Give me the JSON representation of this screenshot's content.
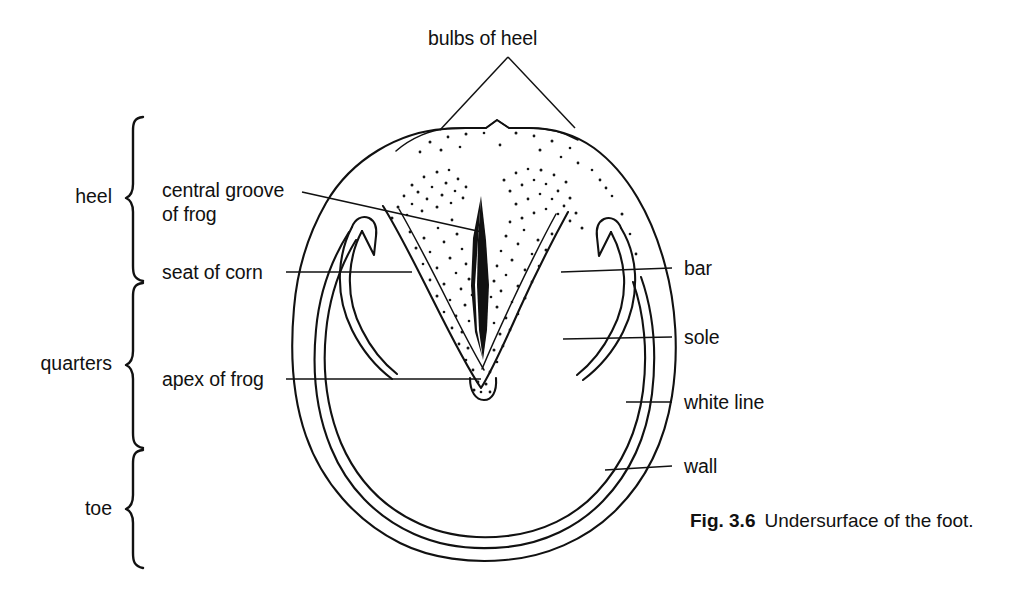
{
  "figure": {
    "title_label": "bulbs of heel",
    "caption_number": "Fig. 3.6",
    "caption_text": "Undersurface of the foot.",
    "ink_color": "#111111",
    "background_color": "#ffffff"
  },
  "region_brackets": [
    {
      "name": "heel",
      "label": "heel"
    },
    {
      "name": "quarters",
      "label": "quarters"
    },
    {
      "name": "toe",
      "label": "toe"
    }
  ],
  "labels_left": [
    {
      "name": "central-groove-of-frog",
      "line1": "central groove",
      "line2": "of frog"
    },
    {
      "name": "seat-of-corn",
      "line1": "seat of corn",
      "line2": ""
    },
    {
      "name": "apex-of-frog",
      "line1": "apex of frog",
      "line2": ""
    }
  ],
  "labels_right": [
    {
      "name": "bar",
      "text": "bar"
    },
    {
      "name": "sole",
      "text": "sole"
    },
    {
      "name": "white-line",
      "text": "white line"
    },
    {
      "name": "wall",
      "text": "wall"
    }
  ],
  "labels_top": [
    {
      "name": "bulbs-of-heel",
      "text": "bulbs of heel"
    }
  ]
}
